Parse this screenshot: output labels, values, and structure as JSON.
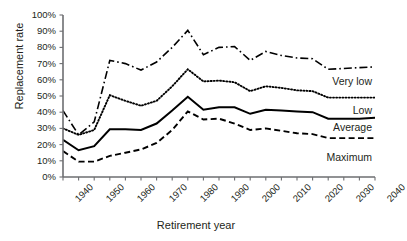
{
  "chart_data": {
    "type": "line",
    "title": "",
    "xlabel": "Retirement year",
    "ylabel": "Replacement rate",
    "xlim": [
      1940,
      2040
    ],
    "ylim": [
      0,
      100
    ],
    "grid": false,
    "legend_position": "inline-right",
    "x": [
      1940,
      1945,
      1950,
      1955,
      1960,
      1965,
      1970,
      1975,
      1980,
      1985,
      1990,
      1995,
      2000,
      2005,
      2010,
      2015,
      2020,
      2025,
      2030,
      2035,
      2040
    ],
    "xticklabels": [
      "1940",
      "1950",
      "1960",
      "1970",
      "1980",
      "1990",
      "2000",
      "2010",
      "2020",
      "2030",
      "2040"
    ],
    "xtickvalues": [
      1940,
      1950,
      1960,
      1970,
      1980,
      1990,
      2000,
      2010,
      2020,
      2030,
      2040
    ],
    "yticklabels": [
      "0%",
      "10%",
      "20%",
      "30%",
      "40%",
      "50%",
      "60%",
      "70%",
      "80%",
      "90%",
      "100%"
    ],
    "ytickvalues": [
      0,
      10,
      20,
      30,
      40,
      50,
      60,
      70,
      80,
      90,
      100
    ],
    "series": [
      {
        "name": "Very low",
        "style": "dash-dot",
        "values": [
          41,
          26,
          34,
          72,
          70,
          66,
          71,
          80,
          90.5,
          75.5,
          80,
          80.5,
          72,
          77.5,
          75,
          73.5,
          73,
          66.5,
          67,
          67.5,
          68
        ]
      },
      {
        "name": "Low",
        "style": "dotted",
        "values": [
          30,
          26,
          29,
          50.5,
          47,
          44,
          47,
          56,
          66.5,
          59,
          59.5,
          58.5,
          53,
          56,
          55,
          53.5,
          53,
          49,
          49,
          49,
          49
        ]
      },
      {
        "name": "Average",
        "style": "solid",
        "values": [
          23,
          16.5,
          19,
          29.5,
          29.5,
          29,
          33,
          41,
          49.5,
          41.5,
          43,
          43,
          39,
          41.5,
          41,
          40.5,
          40,
          36,
          36,
          36,
          36.5
        ]
      },
      {
        "name": "Maximum",
        "style": "dashed",
        "values": [
          16,
          9.5,
          9.5,
          13,
          15,
          17,
          21,
          29,
          40.5,
          35.5,
          36,
          33,
          29,
          30,
          28.5,
          27,
          26.5,
          24,
          24,
          24,
          24
        ]
      }
    ],
    "colors": {
      "line": "#000000",
      "axis": "#6d6e71",
      "text": "#231f20",
      "background": "#ffffff"
    },
    "series_labels": [
      {
        "name": "Very low",
        "x": 372,
        "y": 76
      },
      {
        "name": "Low",
        "x": 372,
        "y": 105
      },
      {
        "name": "Average",
        "x": 372,
        "y": 122
      },
      {
        "name": "Maximum",
        "x": 372,
        "y": 152
      }
    ]
  }
}
